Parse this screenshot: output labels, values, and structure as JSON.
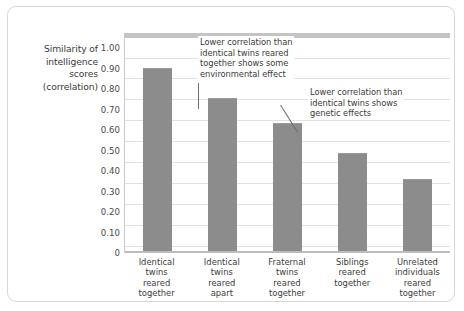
{
  "chart_data": {
    "type": "bar",
    "title": "",
    "subtitle": "",
    "xlabel": "",
    "ylabel": "Similarity of intelligence scores (correlation)",
    "ylabel_lines": [
      "Similarity of",
      "intelligence",
      "scores",
      "(correlation)"
    ],
    "ylim": [
      0,
      1.0
    ],
    "ytick_labels": [
      "1.00",
      "0.90",
      "0.80",
      "0.70",
      "0.60",
      "0.50",
      "0.40",
      "0.30",
      "0.20",
      "0.10",
      "0"
    ],
    "ytick_values": [
      1.0,
      0.9,
      0.8,
      0.7,
      0.6,
      0.5,
      0.4,
      0.3,
      0.2,
      0.1,
      0
    ],
    "grid": true,
    "legend": "none",
    "categories": [
      "Identical twins reared together",
      "Identical twins reared apart",
      "Fraternal twins reared together",
      "Siblings reared together",
      "Unrelated individuals reared together"
    ],
    "category_lines": [
      [
        "Identical",
        "twins",
        "reared",
        "together"
      ],
      [
        "Identical",
        "twins",
        "reared",
        "apart"
      ],
      [
        "Fraternal",
        "twins",
        "reared",
        "together"
      ],
      [
        "Siblings",
        "reared",
        "together"
      ],
      [
        "Unrelated",
        "individuals",
        "reared",
        "together"
      ]
    ],
    "values": [
      0.86,
      0.72,
      0.6,
      0.46,
      0.34
    ],
    "bar_color": "#8c8c8c",
    "grid_color": "#e2e2e2",
    "annotations": [
      {
        "id": "annotation-1",
        "text": "Lower correlation than identical twins reared together shows some environmental effect",
        "lines": [
          "Lower correlation than",
          "identical twins reared",
          "together shows some",
          "environmental effect"
        ],
        "points_to_category": "Identical twins reared apart"
      },
      {
        "id": "annotation-2",
        "text": "Lower correlation than identical twins shows genetic effects",
        "lines": [
          "Lower correlation than",
          "identical twins shows",
          "genetic effects"
        ],
        "points_to_category": "Fraternal twins reared together"
      }
    ]
  }
}
